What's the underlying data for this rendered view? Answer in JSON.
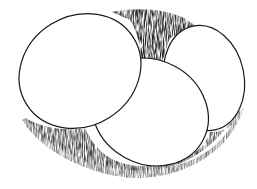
{
  "image": {
    "subject": "Pen-and-ink illustration of three eggs in a nest",
    "style": "black ink hatching on white",
    "colors": {
      "background": "#ffffff",
      "ink": "#1a1a1a",
      "egg_fill": "#ffffff",
      "hatch_dark": "#2a2a2a",
      "hatch_mid": "#555555",
      "hatch_light": "#8a8a8a"
    },
    "elements": [
      {
        "name": "egg-large-left",
        "description": "Large egg tilted, upper left"
      },
      {
        "name": "egg-right",
        "description": "Egg standing upright, right side"
      },
      {
        "name": "egg-front",
        "description": "Egg lying in front, overlapping the other two"
      },
      {
        "name": "nest-shadow",
        "description": "Hatched nest / shadow surrounding the eggs"
      }
    ]
  }
}
